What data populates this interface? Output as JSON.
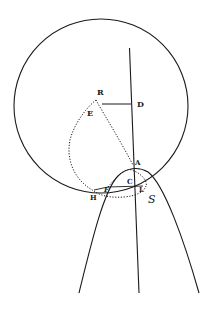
{
  "diagram": {
    "type": "geometric-figure",
    "colors": {
      "ink": "#1a1a1a",
      "background": "#ffffff"
    },
    "labels": {
      "R": "R",
      "D": "D",
      "E": "E",
      "A": "A",
      "C": "C",
      "F": "F",
      "H": "H",
      "L": "L",
      "S": "S"
    },
    "elements": {
      "circle": "large circle",
      "axis": "vertical axis line through D and A",
      "parabola": "parabola with vertex near A opening downward",
      "dotted_curve": "dotted closed curve through R, E, H, F, A",
      "small_dotted_arc": "dotted arc near C, L, S"
    }
  }
}
